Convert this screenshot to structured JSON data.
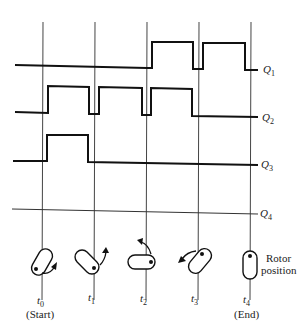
{
  "diagram": {
    "type": "timing-diagram",
    "signals": [
      {
        "name": "Q",
        "sub": "1",
        "levels": [
          0,
          0,
          1,
          1
        ],
        "label_y": 69
      },
      {
        "name": "Q",
        "sub": "2",
        "levels": [
          1,
          1,
          1,
          0
        ],
        "label_y": 117
      },
      {
        "name": "Q",
        "sub": "3",
        "levels": [
          1,
          0,
          0,
          0
        ],
        "label_y": 165
      },
      {
        "name": "Q",
        "sub": "4",
        "levels": [
          0,
          0,
          0,
          0
        ],
        "label_y": 214
      }
    ],
    "time_points": [
      {
        "name": "t",
        "sub": "0",
        "caption": "(Start)"
      },
      {
        "name": "t",
        "sub": "1",
        "caption": ""
      },
      {
        "name": "t",
        "sub": "2",
        "caption": ""
      },
      {
        "name": "t",
        "sub": "3",
        "caption": ""
      },
      {
        "name": "t",
        "sub": "4",
        "caption": "(End)"
      }
    ],
    "rotor_caption_line1": "Rotor",
    "rotor_caption_line2": "position",
    "rotor_angles_deg": [
      30,
      -45,
      90,
      30,
      0
    ],
    "rotation_direction": "counter-clockwise"
  }
}
